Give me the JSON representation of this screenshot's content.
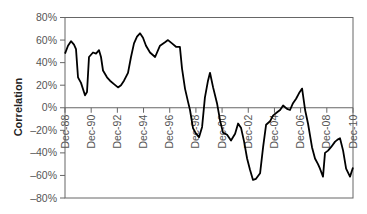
{
  "chart_data": {
    "type": "line",
    "title": "",
    "xlabel": "",
    "ylabel": "Correlation",
    "ylim": [
      -80,
      80
    ],
    "xlim": [
      1988.92,
      2010.92
    ],
    "grid": false,
    "legend": null,
    "y_ticks": [
      {
        "value": 80,
        "label": "80%"
      },
      {
        "value": 60,
        "label": "60%"
      },
      {
        "value": 40,
        "label": "40%"
      },
      {
        "value": 20,
        "label": "20%"
      },
      {
        "value": 0,
        "label": "0%"
      },
      {
        "value": -20,
        "label": "–20%"
      },
      {
        "value": -40,
        "label": "–40%"
      },
      {
        "value": -60,
        "label": "–60%"
      },
      {
        "value": -80,
        "label": "–80%"
      }
    ],
    "x_ticks": [
      {
        "value": 1988.92,
        "label": "Dec-88"
      },
      {
        "value": 1990.92,
        "label": "Dec-90"
      },
      {
        "value": 1992.92,
        "label": "Dec-92"
      },
      {
        "value": 1994.92,
        "label": "Dec-94"
      },
      {
        "value": 1996.92,
        "label": "Dec-96"
      },
      {
        "value": 1998.92,
        "label": "Dec-98"
      },
      {
        "value": 2000.92,
        "label": "Dec-00"
      },
      {
        "value": 2002.92,
        "label": "Dec-02"
      },
      {
        "value": 2004.92,
        "label": "Dec-04"
      },
      {
        "value": 2006.92,
        "label": "Dec-06"
      },
      {
        "value": 2008.92,
        "label": "Dec-08"
      },
      {
        "value": 2010.92,
        "label": "Dec-10"
      }
    ],
    "series": [
      {
        "name": "Correlation",
        "color": "#000000",
        "points": [
          [
            1988.92,
            48
          ],
          [
            1989.15,
            55
          ],
          [
            1989.38,
            59
          ],
          [
            1989.61,
            56
          ],
          [
            1989.76,
            52
          ],
          [
            1989.91,
            27
          ],
          [
            1990.14,
            22
          ],
          [
            1990.45,
            11
          ],
          [
            1990.6,
            14
          ],
          [
            1990.75,
            45
          ],
          [
            1991.06,
            49
          ],
          [
            1991.29,
            48
          ],
          [
            1991.52,
            51
          ],
          [
            1991.67,
            45
          ],
          [
            1991.82,
            33
          ],
          [
            1992.13,
            27
          ],
          [
            1992.36,
            24
          ],
          [
            1992.66,
            21
          ],
          [
            1992.97,
            18
          ],
          [
            1993.2,
            20
          ],
          [
            1993.43,
            24
          ],
          [
            1993.73,
            31
          ],
          [
            1993.96,
            45
          ],
          [
            1994.19,
            57
          ],
          [
            1994.42,
            63
          ],
          [
            1994.65,
            66
          ],
          [
            1994.88,
            62
          ],
          [
            1995.11,
            55
          ],
          [
            1995.41,
            49
          ],
          [
            1995.8,
            45
          ],
          [
            1996.18,
            55
          ],
          [
            1996.56,
            58
          ],
          [
            1996.79,
            60
          ],
          [
            1997.09,
            57
          ],
          [
            1997.4,
            54
          ],
          [
            1997.7,
            54
          ],
          [
            1997.86,
            35
          ],
          [
            1998.09,
            17
          ],
          [
            1998.32,
            5
          ],
          [
            1998.47,
            -2
          ],
          [
            1998.7,
            -18
          ],
          [
            1998.93,
            -23
          ],
          [
            1999.16,
            -26
          ],
          [
            1999.39,
            -17
          ],
          [
            1999.61,
            9
          ],
          [
            1999.84,
            24
          ],
          [
            2000.0,
            31
          ],
          [
            2000.23,
            18
          ],
          [
            2000.53,
            4
          ],
          [
            2000.76,
            -11
          ],
          [
            2000.99,
            -22
          ],
          [
            2001.3,
            -24
          ],
          [
            2001.6,
            -29
          ],
          [
            2001.91,
            -23
          ],
          [
            2002.14,
            -14
          ],
          [
            2002.37,
            -18
          ],
          [
            2002.6,
            -30
          ],
          [
            2002.83,
            -45
          ],
          [
            2003.05,
            -55
          ],
          [
            2003.28,
            -64
          ],
          [
            2003.51,
            -63
          ],
          [
            2003.82,
            -58
          ],
          [
            2004.05,
            -35
          ],
          [
            2004.28,
            -15
          ],
          [
            2004.58,
            -12
          ],
          [
            2004.81,
            -7
          ],
          [
            2005.12,
            -4
          ],
          [
            2005.35,
            -2
          ],
          [
            2005.58,
            2
          ],
          [
            2005.88,
            -1
          ],
          [
            2006.11,
            -2
          ],
          [
            2006.34,
            4
          ],
          [
            2006.57,
            8
          ],
          [
            2006.8,
            13
          ],
          [
            2007.03,
            17
          ],
          [
            2007.26,
            -2
          ],
          [
            2007.48,
            -14
          ],
          [
            2007.79,
            -35
          ],
          [
            2008.02,
            -45
          ],
          [
            2008.25,
            -50
          ],
          [
            2008.4,
            -54
          ],
          [
            2008.63,
            -61
          ],
          [
            2008.78,
            -40
          ],
          [
            2009.01,
            -38
          ],
          [
            2009.24,
            -35
          ],
          [
            2009.55,
            -30
          ],
          [
            2009.78,
            -28
          ],
          [
            2009.93,
            -27
          ],
          [
            2010.16,
            -38
          ],
          [
            2010.39,
            -54
          ],
          [
            2010.69,
            -61
          ],
          [
            2010.92,
            -53
          ]
        ]
      }
    ]
  }
}
